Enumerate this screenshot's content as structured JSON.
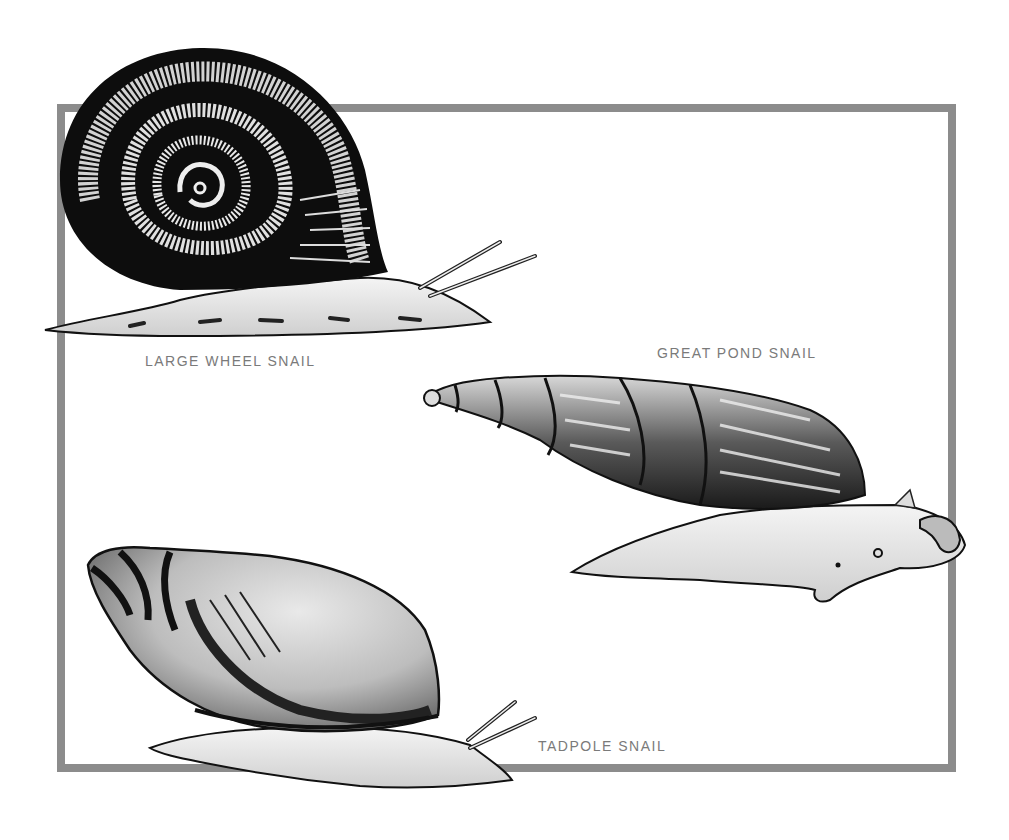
{
  "illustration": {
    "subject": "Freshwater snails",
    "frame_color": "#8c8c8c",
    "label_color": "#7a7a7a",
    "snails": [
      {
        "id": "large-wheel",
        "label": "LARGE WHEEL SNAIL",
        "shell": "planispiral coiled, dark with pale bands"
      },
      {
        "id": "great-pond",
        "label": "GREAT POND SNAIL",
        "shell": "tall tapered spire, striated"
      },
      {
        "id": "tadpole",
        "label": "TADPOLE SNAIL",
        "shell": "ovate with short spire"
      }
    ]
  }
}
